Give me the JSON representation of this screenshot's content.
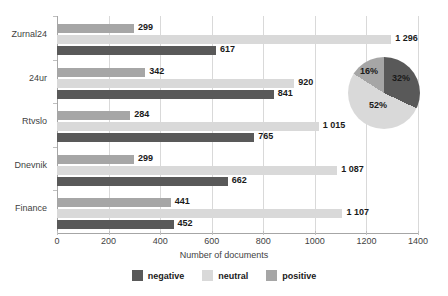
{
  "chart_data": {
    "type": "bar",
    "orientation": "horizontal",
    "title": "",
    "xlabel": "Number of documents",
    "ylabel": "",
    "xlim": [
      0,
      1400
    ],
    "xticks": [
      0,
      200,
      400,
      600,
      800,
      1000,
      1200,
      1400
    ],
    "xticklabels": [
      "0",
      "200",
      "400",
      "600",
      "800",
      "1000",
      "1200",
      "1400"
    ],
    "grid": true,
    "legend_position": "bottom",
    "categories": [
      "Zurnal24",
      "24ur",
      "Rtvslo",
      "Dnevnik",
      "Finance"
    ],
    "series": [
      {
        "name": "negative",
        "color": "#595959",
        "values": [
          617,
          841,
          765,
          662,
          452
        ],
        "labels": [
          "617",
          "841",
          "765",
          "662",
          "452"
        ]
      },
      {
        "name": "neutral",
        "color": "#d9d9d9",
        "values": [
          1296,
          920,
          1015,
          1087,
          1107
        ],
        "labels": [
          "1 296",
          "920",
          "1 015",
          "1 087",
          "1 107"
        ]
      },
      {
        "name": "positive",
        "color": "#a6a6a6",
        "values": [
          299,
          342,
          284,
          299,
          441
        ],
        "labels": [
          "299",
          "342",
          "284",
          "299",
          "441"
        ]
      }
    ],
    "bar_order_top_to_bottom": [
      "positive",
      "neutral",
      "negative"
    ],
    "inset_pie": {
      "type": "pie",
      "labels": [
        "negative",
        "neutral",
        "positive"
      ],
      "values": [
        32,
        52,
        16
      ],
      "display_labels": [
        "32%",
        "52%",
        "16%"
      ],
      "colors": [
        "#595959",
        "#d9d9d9",
        "#a6a6a6"
      ]
    }
  },
  "legend": {
    "items": [
      {
        "label": "negative",
        "color": "#595959"
      },
      {
        "label": "neutral",
        "color": "#d9d9d9"
      },
      {
        "label": "positive",
        "color": "#a6a6a6"
      }
    ]
  },
  "axis": {
    "x_title": "Number of documents"
  }
}
